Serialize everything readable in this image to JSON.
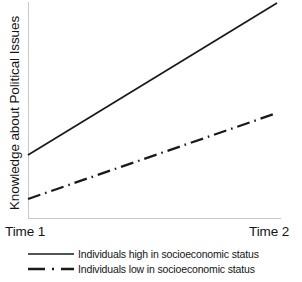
{
  "chart_data": {
    "type": "line",
    "title": "",
    "subtitle": "",
    "xlabel": "",
    "ylabel": "Knowledge about Political Issues",
    "categories": [
      "Time 1",
      "Time 2"
    ],
    "x_tick_labels": [
      "Time 1",
      "Time 2"
    ],
    "y_tick_labels": [],
    "grid": false,
    "legend_position": "bottom",
    "axis_color": "#c8c8c8",
    "line_color": "#1a1a1a",
    "xlim": [
      0,
      1
    ],
    "ylim": [
      0,
      1
    ],
    "series": [
      {
        "name": "Individuals high in socioeconomic status",
        "style": "solid",
        "color": "#1a1a1a",
        "values": [
          0.29,
          1.0
        ],
        "pixel_points": [
          [
            28,
            155
          ],
          [
            277,
            3
          ]
        ]
      },
      {
        "name": "Individuals low in socioeconomic status",
        "style": "dash-dot",
        "color": "#1a1a1a",
        "values": [
          0.09,
          0.49
        ],
        "pixel_points": [
          [
            28,
            199
          ],
          [
            277,
            113
          ]
        ]
      }
    ],
    "annotations": []
  },
  "axis": {
    "y_title": "Knowledge about Political Issues",
    "x_left_label": "Time 1",
    "x_right_label": "Time 2"
  },
  "legend": {
    "items": [
      {
        "label": "Individuals high in socioeconomic status",
        "style": "solid"
      },
      {
        "label": "Individuals low in socioeconomic status",
        "style": "dash-dot"
      }
    ]
  }
}
